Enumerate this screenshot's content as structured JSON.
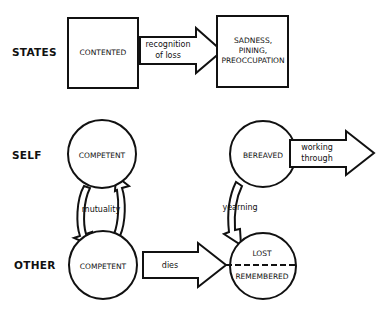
{
  "rows": {
    "states": "STATES",
    "self": "SELF",
    "other": "OTHER"
  },
  "states": {
    "before": "CONTENTED",
    "transition": [
      "recognition",
      "of loss"
    ],
    "after": [
      "SADNESS,",
      "PINING,",
      "PREOCCUPATION"
    ]
  },
  "self": {
    "before": "COMPETENT",
    "after": "BEREAVED",
    "exit_arrow": [
      "working",
      "through"
    ]
  },
  "other": {
    "before": "COMPETENT",
    "transition": "dies",
    "after_top": "LOST",
    "after_bottom": "REMEMBERED"
  },
  "links": {
    "mutuality": "mutuality",
    "yearning": "yearning"
  },
  "colors": {
    "ink": "#111111",
    "background": "#ffffff"
  }
}
